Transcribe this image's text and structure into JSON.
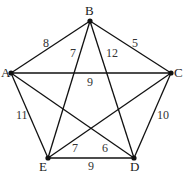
{
  "diagram": {
    "type": "weighted-complete-graph",
    "vertices": [
      {
        "id": "A",
        "label": "A",
        "x": 11,
        "y": 73,
        "lx": 1,
        "ly": 77
      },
      {
        "id": "B",
        "label": "B",
        "x": 90,
        "y": 21,
        "lx": 85,
        "ly": 15
      },
      {
        "id": "C",
        "label": "C",
        "x": 171,
        "y": 73,
        "lx": 174,
        "ly": 77
      },
      {
        "id": "D",
        "label": "D",
        "x": 134,
        "y": 158,
        "lx": 130,
        "ly": 171
      },
      {
        "id": "E",
        "label": "E",
        "x": 48,
        "y": 158,
        "lx": 39,
        "ly": 171
      }
    ],
    "edges": [
      {
        "from": "A",
        "to": "B",
        "weight": "8",
        "lx": 43,
        "ly": 47
      },
      {
        "from": "B",
        "to": "C",
        "weight": "5",
        "lx": 132,
        "ly": 47
      },
      {
        "from": "B",
        "to": "E",
        "weight": "7",
        "lx": 70,
        "ly": 57
      },
      {
        "from": "B",
        "to": "D",
        "weight": "12",
        "lx": 106,
        "ly": 57
      },
      {
        "from": "A",
        "to": "C",
        "weight": "9",
        "lx": 87,
        "ly": 86
      },
      {
        "from": "A",
        "to": "E",
        "weight": "11",
        "lx": 16,
        "ly": 119
      },
      {
        "from": "C",
        "to": "D",
        "weight": "10",
        "lx": 157,
        "ly": 119
      },
      {
        "from": "E",
        "to": "C",
        "weight": "7",
        "lx": 72,
        "ly": 152
      },
      {
        "from": "A",
        "to": "D",
        "weight": "6",
        "lx": 102,
        "ly": 152
      },
      {
        "from": "E",
        "to": "D",
        "weight": "9",
        "lx": 88,
        "ly": 170
      }
    ]
  }
}
